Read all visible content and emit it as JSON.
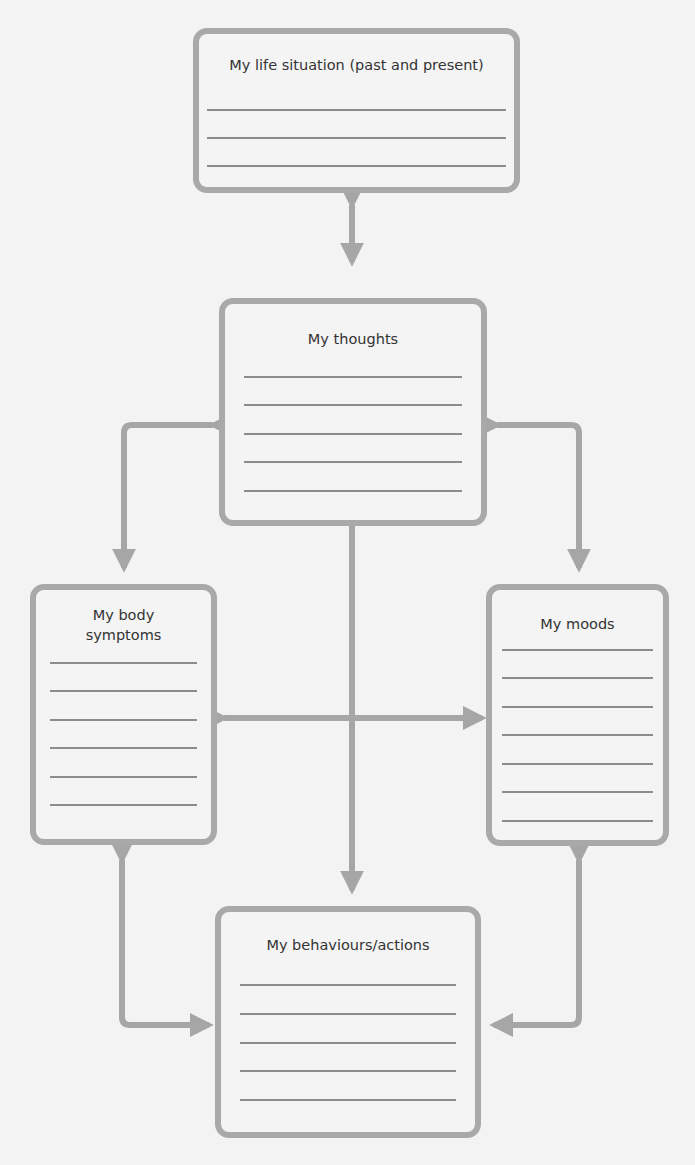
{
  "diagram": {
    "boxes": {
      "life_situation": {
        "title": "My life situation (past and present)",
        "lines": 3
      },
      "thoughts": {
        "title": "My thoughts",
        "lines": 5
      },
      "body_symptoms": {
        "title": "My body\nsymptoms",
        "title_line1": "My body",
        "title_line2": "symptoms",
        "lines": 6
      },
      "moods": {
        "title": "My moods",
        "lines": 7
      },
      "behaviours": {
        "title": "My behaviours/actions",
        "lines": 5
      }
    },
    "connections": [
      {
        "from": "life_situation",
        "to": "thoughts",
        "type": "bidirectional"
      },
      {
        "from": "thoughts",
        "to": "body_symptoms",
        "type": "bidirectional"
      },
      {
        "from": "thoughts",
        "to": "moods",
        "type": "bidirectional"
      },
      {
        "from": "thoughts",
        "to": "behaviours",
        "type": "bidirectional"
      },
      {
        "from": "body_symptoms",
        "to": "moods",
        "type": "bidirectional"
      },
      {
        "from": "body_symptoms",
        "to": "behaviours",
        "type": "bidirectional"
      },
      {
        "from": "moods",
        "to": "behaviours",
        "type": "bidirectional"
      }
    ],
    "colors": {
      "border": "#a9a9a9",
      "arrow": "#a6a6a6",
      "rule_line": "#8c8c8c",
      "background": "#f3f3f3"
    }
  }
}
